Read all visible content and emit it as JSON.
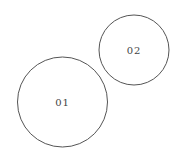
{
  "diagram": {
    "type": "circles",
    "nodes": [
      {
        "id": "01",
        "label": "01",
        "cx": 62.5,
        "cy": 102,
        "r": 45
      },
      {
        "id": "02",
        "label": "02",
        "cx": 134,
        "cy": 50,
        "r": 35
      }
    ],
    "colors": {
      "stroke": "#555555",
      "text": "#444444",
      "background": "#ffffff"
    }
  }
}
